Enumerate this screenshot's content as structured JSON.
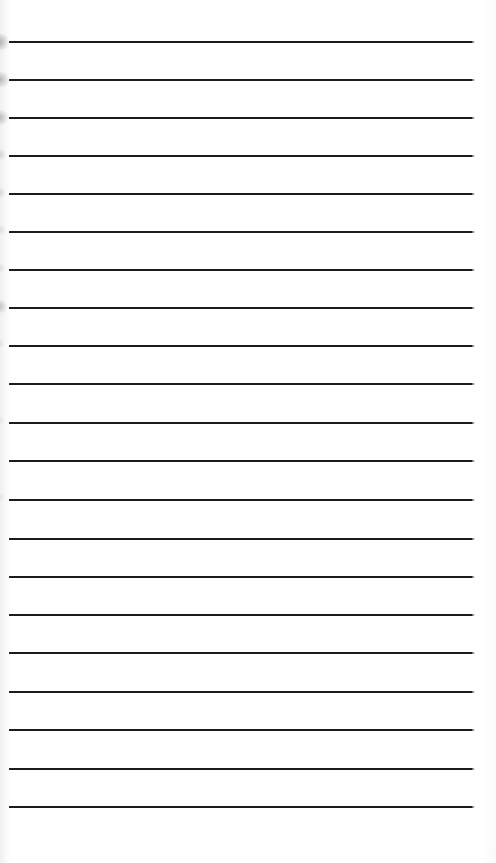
{
  "document": {
    "type": "lined-notepad-page",
    "title": "Blank Ruled Notepad Page",
    "description": "Scanned blank sheet of lined writing paper with horizontal ruled lines and no written content",
    "orientation": "portrait",
    "page_width_px": 496,
    "page_height_px": 863,
    "background_color": "#ffffff",
    "rule_color": "#1c1c1e",
    "rule_thickness_px": 2,
    "rule_left_x_px": 9,
    "rule_right_x_px": 472,
    "rule_length_px": 463,
    "line_spacing_px": 38.3,
    "top_margin_px": 41,
    "bottom_margin_px": 57,
    "total_rule_count": 21,
    "written_text": "",
    "has_handwriting": false,
    "has_printed_text": false
  },
  "rules": [
    {
      "index": 1,
      "y": 41
    },
    {
      "index": 2,
      "y": 79
    },
    {
      "index": 3,
      "y": 117
    },
    {
      "index": 4,
      "y": 155
    },
    {
      "index": 5,
      "y": 193
    },
    {
      "index": 6,
      "y": 231
    },
    {
      "index": 7,
      "y": 269
    },
    {
      "index": 8,
      "y": 307
    },
    {
      "index": 9,
      "y": 345
    },
    {
      "index": 10,
      "y": 383
    },
    {
      "index": 11,
      "y": 422
    },
    {
      "index": 12,
      "y": 460
    },
    {
      "index": 13,
      "y": 499
    },
    {
      "index": 14,
      "y": 538
    },
    {
      "index": 15,
      "y": 576
    },
    {
      "index": 16,
      "y": 614
    },
    {
      "index": 17,
      "y": 652
    },
    {
      "index": 18,
      "y": 691
    },
    {
      "index": 19,
      "y": 729
    },
    {
      "index": 20,
      "y": 768
    },
    {
      "index": 21,
      "y": 806
    }
  ],
  "scan_artifacts": {
    "label": "left-edge scanner smudges",
    "marks": [
      {
        "x": 0,
        "y": 34,
        "w": 20,
        "h": 16,
        "opacity": 0.95
      },
      {
        "x": 0,
        "y": 72,
        "w": 19,
        "h": 15,
        "opacity": 0.85
      },
      {
        "x": 0,
        "y": 110,
        "w": 18,
        "h": 15,
        "opacity": 0.8
      },
      {
        "x": 0,
        "y": 149,
        "w": 13,
        "h": 11,
        "opacity": 0.45
      },
      {
        "x": 0,
        "y": 187,
        "w": 12,
        "h": 11,
        "opacity": 0.4
      },
      {
        "x": 0,
        "y": 225,
        "w": 11,
        "h": 10,
        "opacity": 0.32
      },
      {
        "x": 0,
        "y": 263,
        "w": 11,
        "h": 10,
        "opacity": 0.3
      },
      {
        "x": 0,
        "y": 300,
        "w": 16,
        "h": 13,
        "opacity": 0.7
      },
      {
        "x": 0,
        "y": 339,
        "w": 10,
        "h": 9,
        "opacity": 0.25
      },
      {
        "x": 0,
        "y": 416,
        "w": 10,
        "h": 9,
        "opacity": 0.22
      },
      {
        "x": 0,
        "y": 493,
        "w": 9,
        "h": 8,
        "opacity": 0.18
      }
    ]
  }
}
